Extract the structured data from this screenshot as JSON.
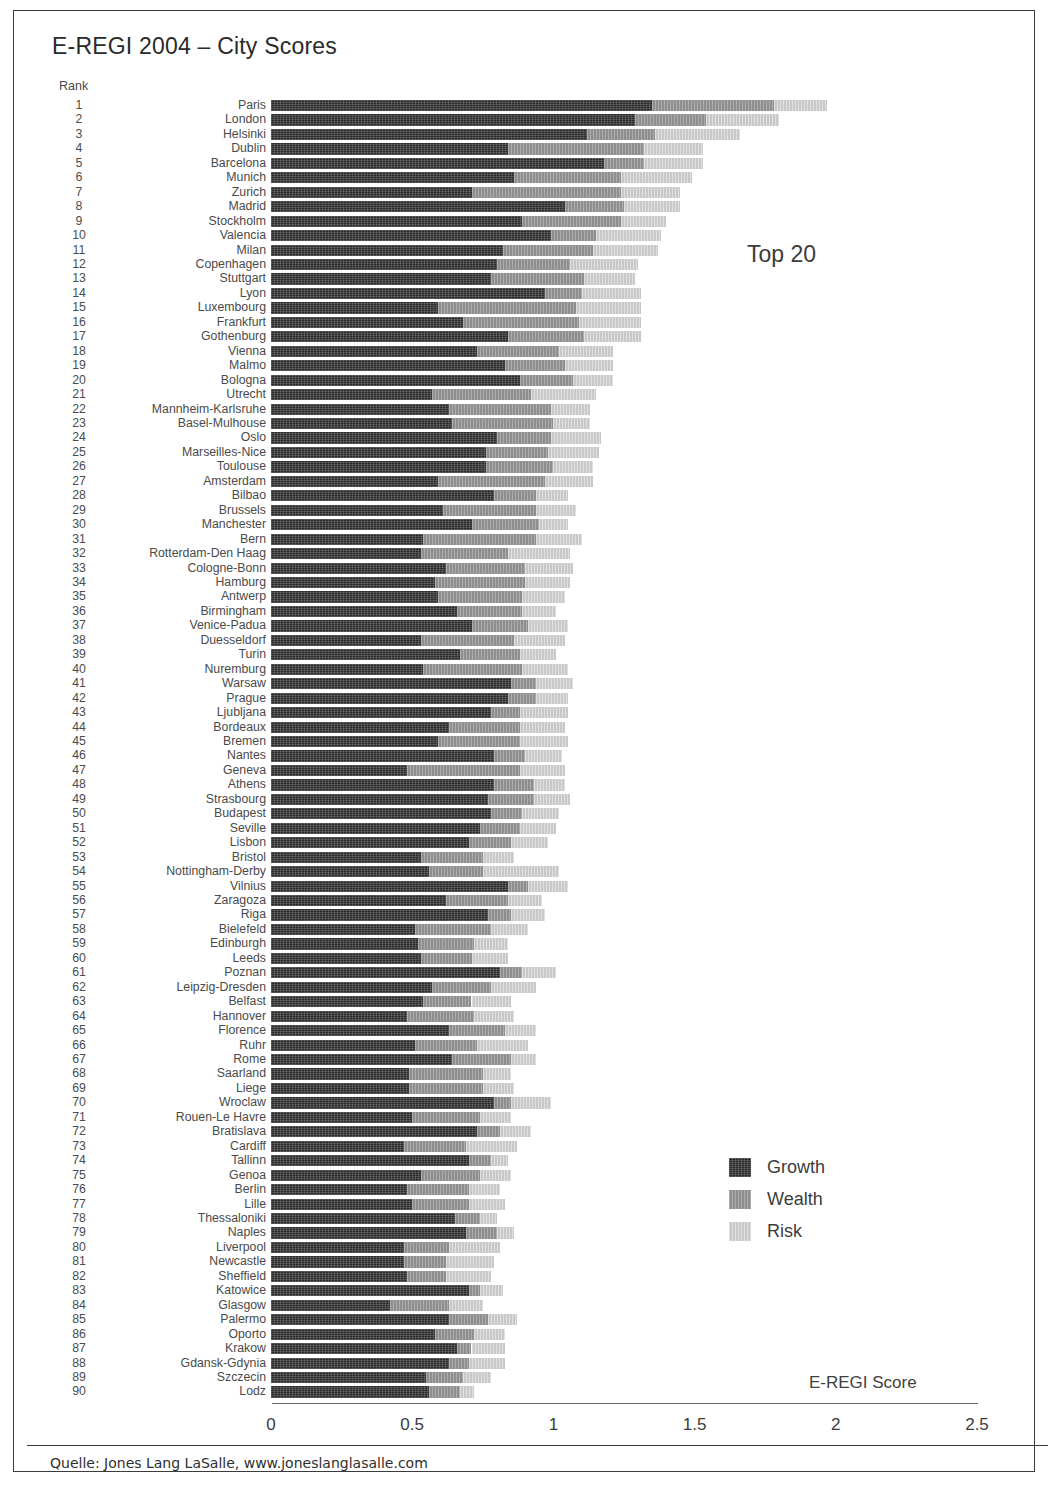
{
  "title": "E-REGI 2004 – City Scores",
  "rank_header": "Rank",
  "annotation": "Top 20",
  "axis_title": "E-REGI Score",
  "source": "Quelle: Jones Lang LaSalle, www.joneslanglasalle.com",
  "legend": {
    "items": [
      {
        "label": "Growth",
        "color": "#2b2b2b"
      },
      {
        "label": "Wealth",
        "color": "#8e8e8e"
      },
      {
        "label": "Risk",
        "color": "#c8c8c8"
      }
    ]
  },
  "chart_data": {
    "type": "bar",
    "orientation": "horizontal",
    "stacked": true,
    "title": "E-REGI 2004 – City Scores",
    "xlabel": "E-REGI Score",
    "ylabel": "Rank",
    "xlim": [
      0,
      2.5
    ],
    "xticks": [
      0,
      0.5,
      1,
      1.5,
      2,
      2.5
    ],
    "xtick_labels": [
      "0",
      "0.5",
      "1",
      "1.5",
      "2",
      "2.5"
    ],
    "grid": false,
    "legend_position": "right-lower",
    "series_names": [
      "Growth",
      "Wealth",
      "Risk"
    ],
    "series_colors": [
      "#2b2b2b",
      "#8e8e8e",
      "#c8c8c8"
    ],
    "categories": [
      "Paris",
      "London",
      "Helsinki",
      "Dublin",
      "Barcelona",
      "Munich",
      "Zurich",
      "Madrid",
      "Stockholm",
      "Valencia",
      "Milan",
      "Copenhagen",
      "Stuttgart",
      "Lyon",
      "Luxembourg",
      "Frankfurt",
      "Gothenburg",
      "Vienna",
      "Malmo",
      "Bologna",
      "Utrecht",
      "Mannheim-Karlsruhe",
      "Basel-Mulhouse",
      "Oslo",
      "Marseilles-Nice",
      "Toulouse",
      "Amsterdam",
      "Bilbao",
      "Brussels",
      "Manchester",
      "Bern",
      "Rotterdam-Den Haag",
      "Cologne-Bonn",
      "Hamburg",
      "Antwerp",
      "Birmingham",
      "Venice-Padua",
      "Duesseldorf",
      "Turin",
      "Nuremburg",
      "Warsaw",
      "Prague",
      "Ljubljana",
      "Bordeaux",
      "Bremen",
      "Nantes",
      "Geneva",
      "Athens",
      "Strasbourg",
      "Budapest",
      "Seville",
      "Lisbon",
      "Bristol",
      "Nottingham-Derby",
      "Vilnius",
      "Zaragoza",
      "Riga",
      "Bielefeld",
      "Edinburgh",
      "Leeds",
      "Poznan",
      "Leipzig-Dresden",
      "Belfast",
      "Hannover",
      "Florence",
      "Ruhr",
      "Rome",
      "Saarland",
      "Liege",
      "Wroclaw",
      "Rouen-Le Havre",
      "Bratislava",
      "Cardiff",
      "Tallinn",
      "Genoa",
      "Berlin",
      "Lille",
      "Thessaloniki",
      "Naples",
      "Liverpool",
      "Newcastle",
      "Sheffield",
      "Katowice",
      "Glasgow",
      "Palermo",
      "Oporto",
      "Krakow",
      "Gdansk-Gdynia",
      "Szczecin",
      "Lodz"
    ],
    "ranks": [
      1,
      2,
      3,
      4,
      5,
      6,
      7,
      8,
      9,
      10,
      11,
      12,
      13,
      14,
      15,
      16,
      17,
      18,
      19,
      20,
      21,
      22,
      23,
      24,
      25,
      26,
      27,
      28,
      29,
      30,
      31,
      32,
      33,
      34,
      35,
      36,
      37,
      38,
      39,
      40,
      41,
      42,
      43,
      44,
      45,
      46,
      47,
      48,
      49,
      50,
      51,
      52,
      53,
      54,
      55,
      56,
      57,
      58,
      59,
      60,
      61,
      62,
      63,
      64,
      65,
      66,
      67,
      68,
      69,
      70,
      71,
      72,
      73,
      74,
      75,
      76,
      77,
      78,
      79,
      80,
      81,
      82,
      83,
      84,
      85,
      86,
      87,
      88,
      89,
      90
    ],
    "series": [
      {
        "name": "Growth",
        "values": [
          1.35,
          1.29,
          1.12,
          0.84,
          1.18,
          0.86,
          0.71,
          1.04,
          0.89,
          0.99,
          0.82,
          0.8,
          0.78,
          0.97,
          0.59,
          0.68,
          0.84,
          0.73,
          0.83,
          0.88,
          0.57,
          0.63,
          0.64,
          0.8,
          0.76,
          0.76,
          0.59,
          0.79,
          0.61,
          0.71,
          0.54,
          0.53,
          0.62,
          0.58,
          0.59,
          0.66,
          0.71,
          0.53,
          0.67,
          0.54,
          0.85,
          0.84,
          0.78,
          0.63,
          0.59,
          0.79,
          0.48,
          0.79,
          0.77,
          0.78,
          0.74,
          0.7,
          0.53,
          0.56,
          0.84,
          0.62,
          0.77,
          0.51,
          0.52,
          0.53,
          0.81,
          0.57,
          0.54,
          0.48,
          0.63,
          0.51,
          0.64,
          0.49,
          0.49,
          0.79,
          0.5,
          0.73,
          0.47,
          0.7,
          0.53,
          0.48,
          0.5,
          0.65,
          0.69,
          0.47,
          0.47,
          0.48,
          0.7,
          0.42,
          0.63,
          0.58,
          0.66,
          0.63,
          0.55,
          0.56
        ],
        "color": "#2b2b2b"
      },
      {
        "name": "Wealth",
        "values": [
          0.43,
          0.25,
          0.24,
          0.48,
          0.14,
          0.38,
          0.53,
          0.21,
          0.35,
          0.16,
          0.32,
          0.26,
          0.33,
          0.13,
          0.49,
          0.41,
          0.27,
          0.29,
          0.21,
          0.19,
          0.35,
          0.36,
          0.36,
          0.19,
          0.22,
          0.24,
          0.38,
          0.15,
          0.33,
          0.24,
          0.4,
          0.31,
          0.28,
          0.32,
          0.3,
          0.23,
          0.2,
          0.33,
          0.21,
          0.35,
          0.09,
          0.1,
          0.1,
          0.25,
          0.29,
          0.11,
          0.4,
          0.14,
          0.16,
          0.11,
          0.14,
          0.15,
          0.22,
          0.19,
          0.07,
          0.22,
          0.08,
          0.27,
          0.2,
          0.18,
          0.08,
          0.21,
          0.17,
          0.24,
          0.2,
          0.22,
          0.21,
          0.26,
          0.26,
          0.06,
          0.24,
          0.08,
          0.22,
          0.08,
          0.21,
          0.22,
          0.2,
          0.09,
          0.11,
          0.16,
          0.15,
          0.14,
          0.04,
          0.21,
          0.14,
          0.14,
          0.05,
          0.07,
          0.13,
          0.11
        ],
        "color": "#8e8e8e"
      },
      {
        "name": "Risk",
        "values": [
          0.19,
          0.26,
          0.3,
          0.21,
          0.21,
          0.25,
          0.21,
          0.2,
          0.16,
          0.23,
          0.23,
          0.24,
          0.18,
          0.21,
          0.23,
          0.22,
          0.2,
          0.19,
          0.17,
          0.14,
          0.23,
          0.14,
          0.13,
          0.18,
          0.18,
          0.14,
          0.17,
          0.11,
          0.14,
          0.1,
          0.16,
          0.22,
          0.17,
          0.16,
          0.15,
          0.12,
          0.14,
          0.18,
          0.13,
          0.16,
          0.13,
          0.11,
          0.17,
          0.16,
          0.17,
          0.13,
          0.16,
          0.11,
          0.13,
          0.13,
          0.13,
          0.13,
          0.11,
          0.27,
          0.14,
          0.12,
          0.12,
          0.13,
          0.12,
          0.13,
          0.12,
          0.16,
          0.14,
          0.14,
          0.11,
          0.18,
          0.09,
          0.1,
          0.11,
          0.14,
          0.11,
          0.11,
          0.18,
          0.06,
          0.11,
          0.11,
          0.13,
          0.06,
          0.06,
          0.18,
          0.17,
          0.16,
          0.08,
          0.12,
          0.1,
          0.11,
          0.12,
          0.13,
          0.1,
          0.05
        ],
        "color": "#c8c8c8"
      }
    ]
  }
}
